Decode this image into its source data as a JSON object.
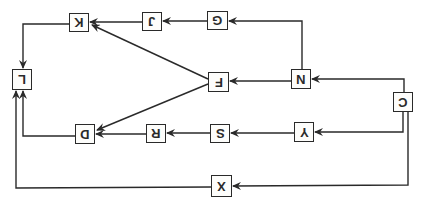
{
  "diagram": {
    "type": "flow-diagram",
    "orientation": "rotated-180",
    "colors": {
      "line": "#2a2a2a",
      "background": "#ffffff"
    },
    "nodes": [
      {
        "id": "C",
        "label": "C",
        "x": 393,
        "y": 92,
        "w": 20,
        "h": 20
      },
      {
        "id": "N",
        "label": "N",
        "x": 291,
        "y": 69,
        "w": 20,
        "h": 20
      },
      {
        "id": "G",
        "label": "G",
        "x": 207,
        "y": 11,
        "w": 21,
        "h": 19
      },
      {
        "id": "J",
        "label": "J",
        "x": 142,
        "y": 12,
        "w": 20,
        "h": 19
      },
      {
        "id": "K",
        "label": "K",
        "x": 69,
        "y": 13,
        "w": 20,
        "h": 19
      },
      {
        "id": "L",
        "label": "L",
        "x": 12,
        "y": 69,
        "w": 20,
        "h": 21
      },
      {
        "id": "F",
        "label": "F",
        "x": 208,
        "y": 72,
        "w": 21,
        "h": 20
      },
      {
        "id": "Y",
        "label": "Y",
        "x": 294,
        "y": 122,
        "w": 20,
        "h": 20
      },
      {
        "id": "S",
        "label": "S",
        "x": 210,
        "y": 124,
        "w": 20,
        "h": 19
      },
      {
        "id": "R",
        "label": "R",
        "x": 146,
        "y": 124,
        "w": 20,
        "h": 19
      },
      {
        "id": "D",
        "label": "D",
        "x": 75,
        "y": 124,
        "w": 20,
        "h": 20
      },
      {
        "id": "X",
        "label": "X",
        "x": 211,
        "y": 175,
        "w": 21,
        "h": 22
      }
    ],
    "edges": [
      {
        "from": "C",
        "to": "N"
      },
      {
        "from": "N",
        "to": "G"
      },
      {
        "from": "G",
        "to": "J"
      },
      {
        "from": "J",
        "to": "K"
      },
      {
        "from": "K",
        "to": "L"
      },
      {
        "from": "N",
        "to": "F"
      },
      {
        "from": "F",
        "to": "K"
      },
      {
        "from": "F",
        "to": "D"
      },
      {
        "from": "C",
        "to": "Y"
      },
      {
        "from": "Y",
        "to": "S"
      },
      {
        "from": "S",
        "to": "R"
      },
      {
        "from": "R",
        "to": "D"
      },
      {
        "from": "D",
        "to": "L"
      },
      {
        "from": "C",
        "to": "X"
      },
      {
        "from": "X",
        "to": "L"
      }
    ]
  }
}
